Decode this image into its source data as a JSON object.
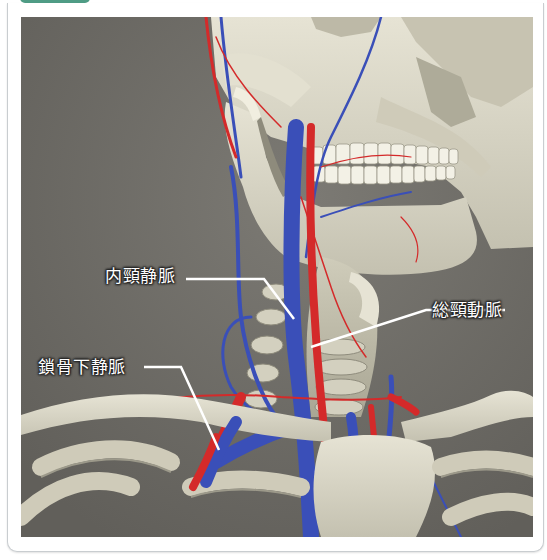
{
  "header": {
    "tab_color": "#4f9c85",
    "title_text_cut_off": true
  },
  "figure": {
    "background_color": "#6f6d68",
    "vein_color": "#3a4fb8",
    "artery_color": "#d42a2a",
    "bone_color": "#d9d6c6",
    "labels": [
      {
        "id": "internal-jugular-vein",
        "text": "内頸静脈"
      },
      {
        "id": "common-carotid-artery",
        "text": "総頸動脈"
      },
      {
        "id": "subclavian-vein",
        "text": "鎖骨下静脈"
      }
    ]
  }
}
